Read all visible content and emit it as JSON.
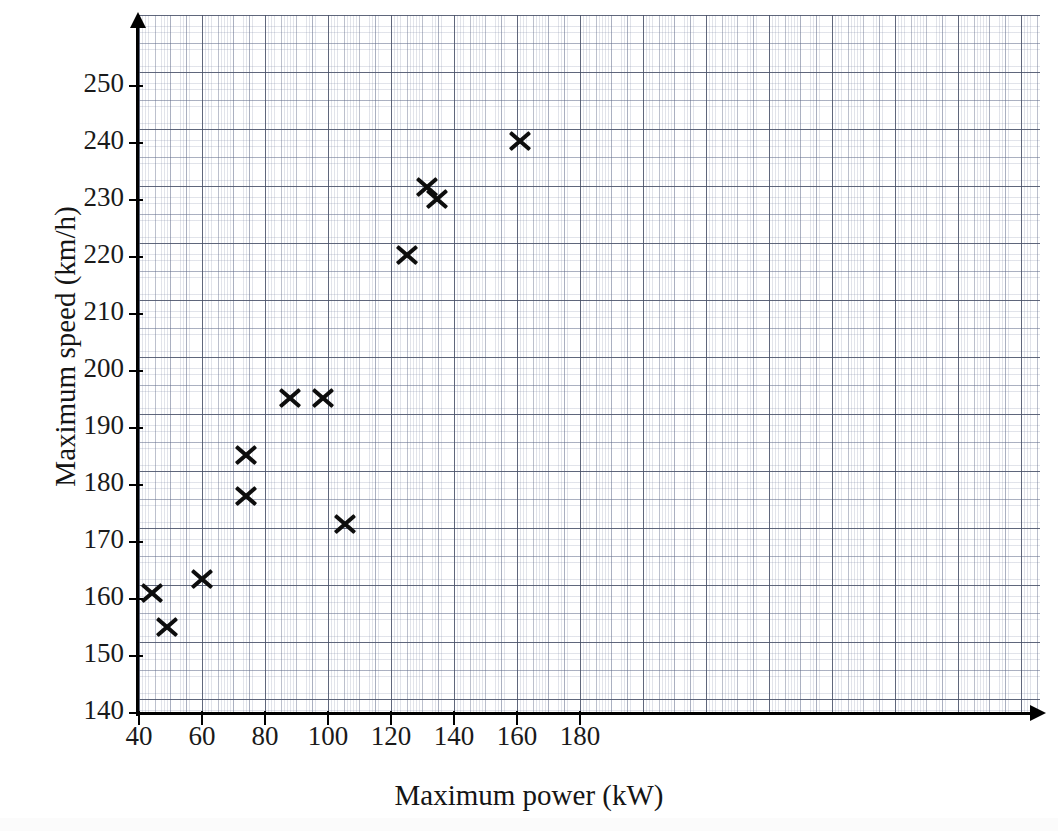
{
  "chart_data": {
    "type": "scatter",
    "title": "",
    "xlabel": "Maximum power (kW)",
    "ylabel": "Maximum speed (km/h)",
    "xlim": [
      40,
      195
    ],
    "ylim": [
      140,
      254
    ],
    "x_ticks": [
      40,
      60,
      80,
      100,
      120,
      140,
      160,
      180
    ],
    "y_ticks": [
      140,
      150,
      160,
      170,
      180,
      190,
      200,
      210,
      220,
      230,
      240,
      250
    ],
    "grid": "graph-paper (1-unit fine, 5-unit medium, major at tick spacing)",
    "legend": "none",
    "marker": "cross-x",
    "marker_color": "#0d0d0d",
    "n_points": 12,
    "points": [
      {
        "x": 44,
        "y": 161.0
      },
      {
        "x": 49,
        "y": 155.0
      },
      {
        "x": 60,
        "y": 163.5
      },
      {
        "x": 74,
        "y": 185.2
      },
      {
        "x": 74,
        "y": 178.0
      },
      {
        "x": 88,
        "y": 195.3
      },
      {
        "x": 98.5,
        "y": 195.3
      },
      {
        "x": 105.5,
        "y": 173.2
      },
      {
        "x": 125,
        "y": 220.3
      },
      {
        "x": 131.5,
        "y": 232.3
      },
      {
        "x": 134.5,
        "y": 230.2
      },
      {
        "x": 161,
        "y": 240.4
      }
    ]
  },
  "axes": {
    "x_tick_labels": [
      "40",
      "60",
      "80",
      "100",
      "120",
      "140",
      "160",
      "180"
    ],
    "y_tick_labels": [
      "140",
      "150",
      "160",
      "170",
      "180",
      "190",
      "200",
      "210",
      "220",
      "230",
      "240",
      "250"
    ],
    "x_title": "Maximum power (kW)",
    "y_title": "Maximum speed (km/h)"
  },
  "scan": {
    "bleed_text": ""
  }
}
